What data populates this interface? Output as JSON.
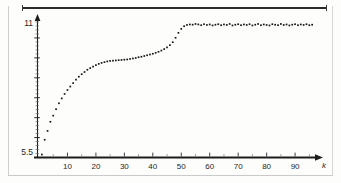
{
  "figure": {
    "kind": "scatter-plot",
    "appearance": "scanned-grayscale",
    "ink_color": "#161616",
    "paper_color": "#fdfdfc",
    "rule_color": "#2b2b2b"
  },
  "axes": {
    "y": {
      "label": "",
      "top_tick_label": "11",
      "bottom_tick_label": "5.5",
      "has_arrow_head": true,
      "minor_ticks_visible": true
    },
    "x": {
      "label": "k",
      "has_arrow_head": true,
      "tick_labels": [
        "10",
        "20",
        "30",
        "40",
        "50",
        "60",
        "70",
        "80",
        "90"
      ],
      "tick_values": [
        10,
        20,
        30,
        40,
        50,
        60,
        70,
        80,
        90
      ]
    }
  },
  "chart_data": {
    "type": "scatter",
    "title": "",
    "xlabel": "k",
    "ylabel": "",
    "xlim": [
      0,
      97
    ],
    "ylim": [
      5.5,
      11.0
    ],
    "grid": false,
    "legend": null,
    "ytick_values": [
      5.5,
      11.0
    ],
    "ytick_labels": [
      "5.5",
      "11"
    ],
    "xtick_values": [
      10,
      20,
      30,
      40,
      50,
      60,
      70,
      80,
      90
    ],
    "xtick_labels": [
      "10",
      "20",
      "30",
      "40",
      "50",
      "60",
      "70",
      "80",
      "90"
    ],
    "series": [
      {
        "name": "measured",
        "marker": "dot",
        "x": [
          1,
          2,
          3,
          4,
          5,
          6,
          7,
          8,
          9,
          10,
          11,
          12,
          13,
          14,
          15,
          16,
          17,
          18,
          19,
          20,
          21,
          22,
          23,
          24,
          25,
          26,
          27,
          28,
          29,
          30,
          31,
          32,
          33,
          34,
          35,
          36,
          37,
          38,
          39,
          40,
          41,
          42,
          43,
          44,
          45,
          46,
          47,
          48,
          49,
          50,
          51,
          52,
          53,
          54,
          55,
          56,
          57,
          58,
          59,
          60,
          61,
          62,
          63,
          64,
          65,
          66,
          67,
          68,
          69,
          70,
          71,
          72,
          73,
          74,
          75,
          76,
          77,
          78,
          79,
          80,
          81,
          82,
          83,
          84,
          85,
          86,
          87,
          88,
          89,
          90,
          91,
          92,
          93,
          94,
          95,
          96
        ],
        "y": [
          5.62,
          6.22,
          6.58,
          6.95,
          7.2,
          7.46,
          7.7,
          7.9,
          8.08,
          8.24,
          8.38,
          8.52,
          8.66,
          8.78,
          8.88,
          8.97,
          9.06,
          9.13,
          9.19,
          9.25,
          9.3,
          9.34,
          9.37,
          9.4,
          9.42,
          9.43,
          9.44,
          9.45,
          9.46,
          9.47,
          9.48,
          9.5,
          9.52,
          9.54,
          9.57,
          9.59,
          9.62,
          9.65,
          9.68,
          9.71,
          9.75,
          9.79,
          9.84,
          9.9,
          9.97,
          10.06,
          10.18,
          10.36,
          10.56,
          10.72,
          10.83,
          10.88,
          10.9,
          10.89,
          10.92,
          10.9,
          10.87,
          10.91,
          10.88,
          10.9,
          10.86,
          10.89,
          10.91,
          10.87,
          10.9,
          10.88,
          10.92,
          10.86,
          10.89,
          10.91,
          10.87,
          10.9,
          10.88,
          10.91,
          10.86,
          10.89,
          10.92,
          10.87,
          10.9,
          10.88,
          10.86,
          10.91,
          10.89,
          10.87,
          10.92,
          10.88,
          10.9,
          10.86,
          10.89,
          10.91,
          10.87,
          10.9,
          10.88,
          10.91,
          10.87,
          10.89
        ]
      }
    ]
  }
}
